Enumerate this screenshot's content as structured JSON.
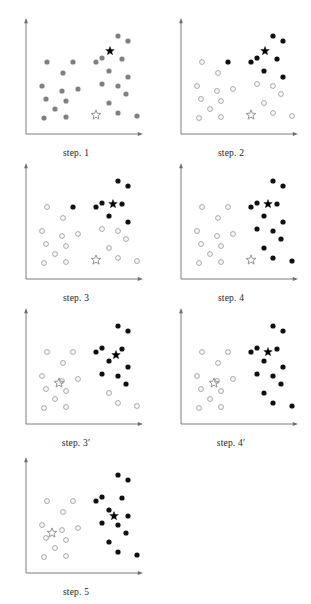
{
  "figure": {
    "panel_count": 7,
    "colors": {
      "axis": "#6e6e6e",
      "gray_point": "#808080",
      "black_point": "#101010",
      "hollow_stroke": "#9a9a9a",
      "hollow_fill": "#ffffff",
      "black_star": "#000000",
      "hollow_star_stroke": "#8a8a8a",
      "caption_text": "#1a1a1a",
      "background": "#ffffff"
    },
    "geometry": {
      "panel_width": 152,
      "panel_height": 148,
      "axis_x": 26,
      "axis_y": 130,
      "axis_top": 14,
      "axis_right": 143,
      "point_radius": 2.6,
      "star_size": 9
    }
  },
  "points": [
    {
      "id": "p1",
      "x": 47,
      "y": 58
    },
    {
      "id": "p2",
      "x": 73,
      "y": 58
    },
    {
      "id": "p3",
      "x": 63,
      "y": 69
    },
    {
      "id": "p4",
      "x": 42,
      "y": 82
    },
    {
      "id": "p5",
      "x": 62,
      "y": 87
    },
    {
      "id": "p6",
      "x": 78,
      "y": 85
    },
    {
      "id": "p7",
      "x": 46,
      "y": 95
    },
    {
      "id": "p8",
      "x": 66,
      "y": 97
    },
    {
      "id": "p9",
      "x": 55,
      "y": 105
    },
    {
      "id": "p10",
      "x": 44,
      "y": 114
    },
    {
      "id": "p11",
      "x": 66,
      "y": 113
    },
    {
      "id": "p12",
      "x": 118,
      "y": 32
    },
    {
      "id": "p13",
      "x": 128,
      "y": 37
    },
    {
      "id": "p14",
      "x": 102,
      "y": 54
    },
    {
      "id": "p15",
      "x": 122,
      "y": 55
    },
    {
      "id": "p16",
      "x": 109,
      "y": 67
    },
    {
      "id": "p17",
      "x": 128,
      "y": 73
    },
    {
      "id": "p18",
      "x": 102,
      "y": 80
    },
    {
      "id": "p19",
      "x": 118,
      "y": 82
    },
    {
      "id": "p20",
      "x": 126,
      "y": 90
    },
    {
      "id": "p21",
      "x": 109,
      "y": 99
    },
    {
      "id": "p22",
      "x": 118,
      "y": 109
    },
    {
      "id": "p23",
      "x": 137,
      "y": 112
    },
    {
      "id": "p24",
      "x": 96,
      "y": 58
    }
  ],
  "panels": [
    {
      "id": "panel-step-1",
      "caption": "step. 1",
      "caption_plain": "step. 1",
      "prime": "",
      "col": 0,
      "row": 0,
      "description": "initial unlabeled data with two seed centroids",
      "point_style": "all-gray",
      "assignments": {
        "p1": "gray",
        "p2": "gray",
        "p3": "gray",
        "p4": "gray",
        "p5": "gray",
        "p6": "gray",
        "p7": "gray",
        "p8": "gray",
        "p9": "gray",
        "p10": "gray",
        "p11": "gray",
        "p12": "gray",
        "p13": "gray",
        "p14": "gray",
        "p15": "gray",
        "p16": "gray",
        "p17": "gray",
        "p18": "gray",
        "p19": "gray",
        "p20": "gray",
        "p21": "gray",
        "p22": "gray",
        "p23": "gray",
        "p24": "gray"
      },
      "black_star": {
        "x": 110,
        "y": 47
      },
      "hollow_star": {
        "x": 96,
        "y": 111
      }
    },
    {
      "id": "panel-step-2",
      "caption": "step. 2",
      "caption_plain": "step. 2",
      "prime": "",
      "col": 1,
      "row": 0,
      "description": "points assigned to nearest seed centroid",
      "point_style": "classified",
      "assignments": {
        "p1": "hollow",
        "p2": "black",
        "p3": "hollow",
        "p4": "hollow",
        "p5": "hollow",
        "p6": "hollow",
        "p7": "hollow",
        "p8": "hollow",
        "p9": "hollow",
        "p10": "hollow",
        "p11": "hollow",
        "p12": "black",
        "p13": "black",
        "p14": "black",
        "p15": "black",
        "p16": "black",
        "p17": "black",
        "p18": "hollow",
        "p19": "hollow",
        "p20": "hollow",
        "p21": "hollow",
        "p22": "hollow",
        "p23": "hollow",
        "p24": "black"
      },
      "black_star": {
        "x": 110,
        "y": 47
      },
      "hollow_star": {
        "x": 96,
        "y": 111
      }
    },
    {
      "id": "panel-step-3",
      "caption": "step. 3",
      "caption_plain": "step. 3",
      "prime": "",
      "col": 0,
      "row": 1,
      "description": "black centroid recomputed from its members",
      "point_style": "classified",
      "assignments": {
        "p1": "hollow",
        "p2": "black",
        "p3": "hollow",
        "p4": "hollow",
        "p5": "hollow",
        "p6": "hollow",
        "p7": "hollow",
        "p8": "hollow",
        "p9": "hollow",
        "p10": "hollow",
        "p11": "hollow",
        "p12": "black",
        "p13": "black",
        "p14": "black",
        "p15": "black",
        "p16": "black",
        "p17": "black",
        "p18": "hollow",
        "p19": "hollow",
        "p20": "hollow",
        "p21": "hollow",
        "p22": "hollow",
        "p23": "hollow",
        "p24": "black"
      },
      "black_star": {
        "x": 113,
        "y": 55
      },
      "hollow_star": {
        "x": 96,
        "y": 111
      }
    },
    {
      "id": "panel-step-4",
      "caption": "step. 4",
      "caption_plain": "step. 4",
      "prime": "",
      "col": 1,
      "row": 1,
      "description": "reassignment with the updated black centroid",
      "point_style": "classified",
      "assignments": {
        "p1": "hollow",
        "p2": "hollow",
        "p3": "hollow",
        "p4": "hollow",
        "p5": "hollow",
        "p6": "hollow",
        "p7": "hollow",
        "p8": "hollow",
        "p9": "hollow",
        "p10": "hollow",
        "p11": "hollow",
        "p12": "black",
        "p13": "black",
        "p14": "black",
        "p15": "black",
        "p16": "black",
        "p17": "black",
        "p18": "black",
        "p19": "black",
        "p20": "black",
        "p21": "black",
        "p22": "black",
        "p23": "black",
        "p24": "black"
      },
      "black_star": {
        "x": 113,
        "y": 55
      },
      "hollow_star": {
        "x": 96,
        "y": 111
      }
    },
    {
      "id": "panel-step-3-prime",
      "caption": "step. 3'",
      "caption_plain": "step. 3",
      "prime": "′",
      "col": 0,
      "row": 2,
      "description": "both centroids recomputed simultaneously",
      "point_style": "classified",
      "assignments": {
        "p1": "hollow",
        "p2": "hollow",
        "p3": "hollow",
        "p4": "hollow",
        "p5": "hollow",
        "p6": "hollow",
        "p7": "hollow",
        "p8": "hollow",
        "p9": "hollow",
        "p10": "hollow",
        "p11": "hollow",
        "p12": "black",
        "p13": "black",
        "p14": "black",
        "p15": "black",
        "p16": "black",
        "p17": "black",
        "p18": "black",
        "p19": "black",
        "p20": "black",
        "p21": "hollow",
        "p22": "hollow",
        "p23": "hollow",
        "p24": "black"
      },
      "black_star": {
        "x": 116,
        "y": 61
      },
      "hollow_star": {
        "x": 59,
        "y": 89
      }
    },
    {
      "id": "panel-step-4-prime",
      "caption": "step. 4'",
      "caption_plain": "step. 4",
      "prime": "′",
      "col": 1,
      "row": 2,
      "description": "reassignment with both updated centroids",
      "point_style": "classified",
      "assignments": {
        "p1": "hollow",
        "p2": "hollow",
        "p3": "hollow",
        "p4": "hollow",
        "p5": "hollow",
        "p6": "hollow",
        "p7": "hollow",
        "p8": "hollow",
        "p9": "hollow",
        "p10": "hollow",
        "p11": "hollow",
        "p12": "black",
        "p13": "black",
        "p14": "black",
        "p15": "black",
        "p16": "black",
        "p17": "black",
        "p18": "black",
        "p19": "black",
        "p20": "black",
        "p21": "black",
        "p22": "black",
        "p23": "black",
        "p24": "black"
      },
      "black_star": {
        "x": 113,
        "y": 58
      },
      "hollow_star": {
        "x": 59,
        "y": 89
      }
    },
    {
      "id": "panel-step-5",
      "caption": "step. 5",
      "caption_plain": "step. 5",
      "prime": "",
      "col": 0,
      "row": 3,
      "description": "converged clusters with final centroids",
      "point_style": "classified",
      "assignments": {
        "p1": "hollow",
        "p2": "hollow",
        "p3": "hollow",
        "p4": "hollow",
        "p5": "hollow",
        "p6": "hollow",
        "p7": "hollow",
        "p8": "hollow",
        "p9": "hollow",
        "p10": "hollow",
        "p11": "hollow",
        "p12": "black",
        "p13": "black",
        "p14": "black",
        "p15": "black",
        "p16": "black",
        "p17": "black",
        "p18": "black",
        "p19": "black",
        "p20": "black",
        "p21": "black",
        "p22": "black",
        "p23": "black",
        "p24": "black"
      },
      "black_star": {
        "x": 114,
        "y": 73
      },
      "hollow_star": {
        "x": 52,
        "y": 90
      }
    }
  ]
}
